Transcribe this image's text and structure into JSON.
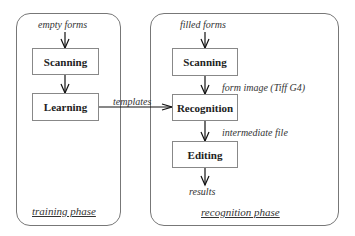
{
  "training": {
    "input_label": "empty forms",
    "boxes": [
      {
        "label": "Scanning"
      },
      {
        "label": "Learning"
      }
    ],
    "phase_label": "training phase"
  },
  "link_label": "templates",
  "recognition": {
    "input_label": "filled forms",
    "boxes": [
      {
        "label": "Scanning"
      },
      {
        "label": "Recognition"
      },
      {
        "label": "Editing"
      }
    ],
    "edge_labels": [
      "form image (Tiff G4)",
      "intermediate file"
    ],
    "output_label": "results",
    "phase_label": "recognition phase"
  }
}
